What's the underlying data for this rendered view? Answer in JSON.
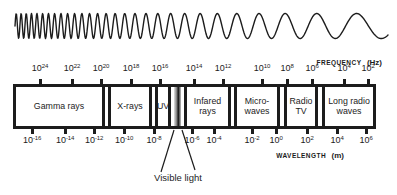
{
  "frequency_axis": {
    "label": "FREQUENCY",
    "unit": "(Hz)",
    "base": "10",
    "exponents": [
      "24",
      "22",
      "20",
      "18",
      "16",
      "14",
      "12",
      "10",
      "8",
      "6",
      "4",
      "2"
    ]
  },
  "wavelength_axis": {
    "label": "WAVELENGTH",
    "unit": "(m)",
    "base": "10",
    "exponents": [
      "-16",
      "-14",
      "-12",
      "-10",
      "-8",
      "-6",
      "-4",
      "-2",
      "0",
      "2",
      "4",
      "6"
    ]
  },
  "bands": [
    {
      "id": "gamma-rays",
      "lines": [
        "Gamma rays"
      ]
    },
    {
      "id": "x-rays",
      "lines": [
        "X-rays"
      ]
    },
    {
      "id": "uv",
      "lines": [
        "UV"
      ]
    },
    {
      "id": "infared-rays",
      "lines": [
        "Infared",
        "rays"
      ]
    },
    {
      "id": "micro-waves",
      "lines": [
        "Micro-",
        "waves"
      ]
    },
    {
      "id": "radio-tv",
      "lines": [
        "Radio",
        "TV"
      ]
    },
    {
      "id": "long-radio-waves",
      "lines": [
        "Long radio",
        "waves"
      ]
    }
  ],
  "visible_light": {
    "label": "Visible light"
  },
  "colors": {
    "ink": "#1c1c1c",
    "paper": "#ffffff",
    "visible_band_gradient": [
      "#e0e0e0",
      "#8a8a8a",
      "#161616",
      "#c2c2c2"
    ]
  }
}
